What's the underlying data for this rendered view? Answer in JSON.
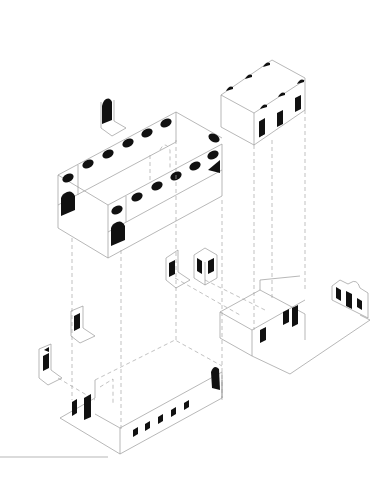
{
  "drawing": {
    "type": "exploded axonometric architectural diagram",
    "background": "#ffffff",
    "line_color": "#9a9a9a",
    "opening_color": "#111111",
    "components": [
      {
        "id": "upper-left-block",
        "description": "Long upper volume with rows of oval windows and arched openings"
      },
      {
        "id": "upper-right-block",
        "description": "Tower top volume with small arched vents and three slit windows"
      },
      {
        "id": "floating-wall-top",
        "description": "Isolated wall fragment with arched opening above upper block"
      },
      {
        "id": "floating-wall-mid-1",
        "description": "Wall fragment with one door"
      },
      {
        "id": "floating-wall-mid-2",
        "description": "Corner wall fragment with two doors"
      },
      {
        "id": "floating-wall-left-1",
        "description": "Wall fragment with door, left side"
      },
      {
        "id": "floating-wall-left-2",
        "description": "Wall fragment with door and triangle, far left"
      },
      {
        "id": "ground-left-block",
        "description": "Long ground volume with five square windows, two doors and an arched door"
      },
      {
        "id": "ground-right-block",
        "description": "Ground volume with three doors and courtyard plate"
      },
      {
        "id": "right-facade",
        "description": "Detached facade with pediment and three openings"
      }
    ]
  }
}
